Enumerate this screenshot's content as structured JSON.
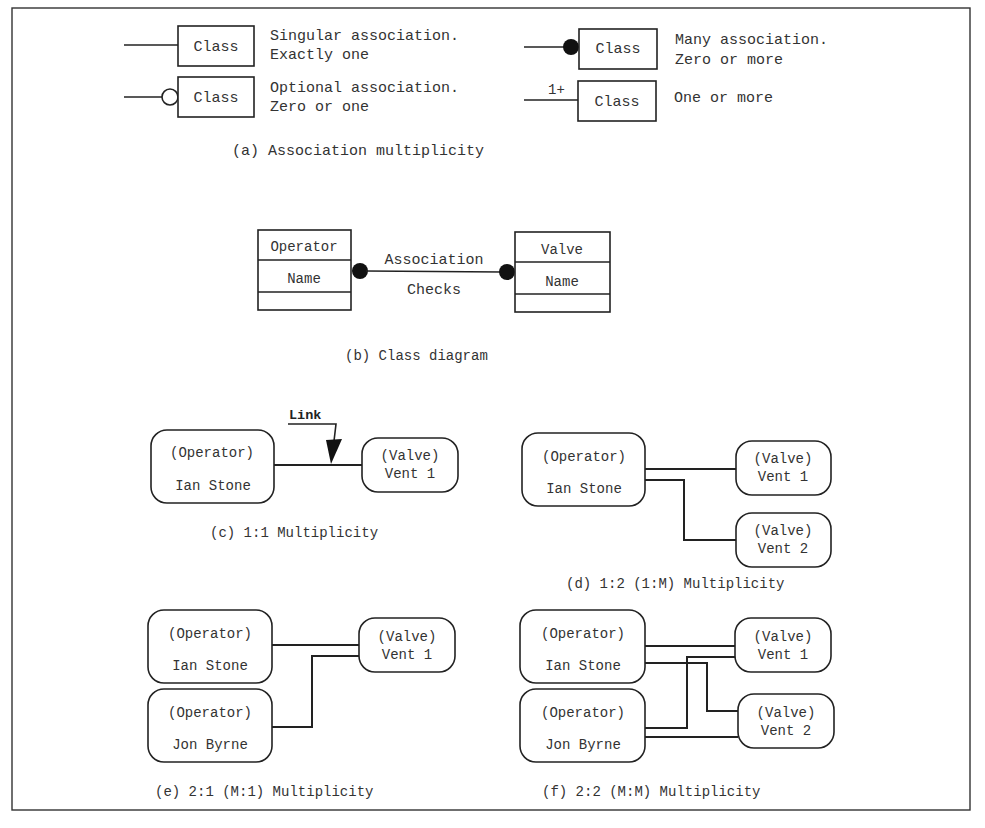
{
  "figure": {
    "frame": {
      "x": 12,
      "y": 8,
      "width": 958,
      "height": 802
    },
    "colors": {
      "stroke": "#222222",
      "text": "#333333",
      "background": "#ffffff"
    }
  },
  "panel_a": {
    "caption": "(a) Association multiplicity",
    "items": [
      {
        "symbol": "plain-line",
        "box_label": "Class",
        "desc_line1": "Singular association.",
        "desc_line2": "Exactly one"
      },
      {
        "symbol": "hollow-circle",
        "box_label": "Class",
        "desc_line1": "Optional association.",
        "desc_line2": "Zero or one"
      },
      {
        "symbol": "filled-circle",
        "box_label": "Class",
        "desc_line1": "Many association.",
        "desc_line2": "Zero or more"
      },
      {
        "symbol": "1+",
        "box_label": "Class",
        "desc_line1": "One or more",
        "desc_line2": ""
      }
    ]
  },
  "panel_b": {
    "caption": "(b) Class diagram",
    "left_class": {
      "name": "Operator",
      "attribute": "Name"
    },
    "right_class": {
      "name": "Valve",
      "attribute": "Name"
    },
    "association_label": "Association",
    "association_name": "Checks"
  },
  "panel_c": {
    "caption": "(c) 1:1 Multiplicity",
    "link_label": "Link",
    "operator": {
      "type": "(Operator)",
      "name": "Ian Stone"
    },
    "valve": {
      "type": "(Valve)",
      "name": "Vent 1"
    }
  },
  "panel_d": {
    "caption": "(d) 1:2 (1:M) Multiplicity",
    "operator": {
      "type": "(Operator)",
      "name": "Ian Stone"
    },
    "valves": [
      {
        "type": "(Valve)",
        "name": "Vent 1"
      },
      {
        "type": "(Valve)",
        "name": "Vent 2"
      }
    ]
  },
  "panel_e": {
    "caption": "(e) 2:1 (M:1) Multiplicity",
    "operators": [
      {
        "type": "(Operator)",
        "name": "Ian Stone"
      },
      {
        "type": "(Operator)",
        "name": "Jon Byrne"
      }
    ],
    "valve": {
      "type": "(Valve)",
      "name": "Vent 1"
    }
  },
  "panel_f": {
    "caption": "(f) 2:2 (M:M) Multiplicity",
    "operators": [
      {
        "type": "(Operator)",
        "name": "Ian Stone"
      },
      {
        "type": "(Operator)",
        "name": "Jon Byrne"
      }
    ],
    "valves": [
      {
        "type": "(Valve)",
        "name": "Vent 1"
      },
      {
        "type": "(Valve)",
        "name": "Vent 2"
      }
    ]
  }
}
